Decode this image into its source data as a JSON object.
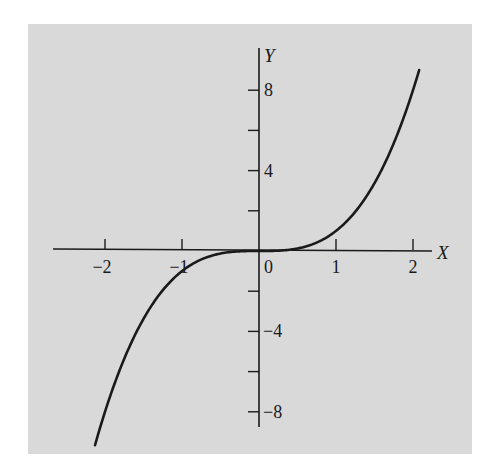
{
  "chart_data": {
    "type": "line",
    "title": "",
    "function": "y = x^3",
    "xlabel": "X",
    "ylabel": "Y",
    "xlim": [
      -2.65,
      2.25
    ],
    "ylim": [
      -8.8,
      10.1
    ],
    "x_ticks": [
      -2,
      -1,
      1,
      2
    ],
    "x_tick_labels": [
      "−2",
      "−1",
      "1",
      "2"
    ],
    "origin_label": "0",
    "y_ticks": [
      -8,
      -6,
      -4,
      -2,
      2,
      4,
      6,
      8
    ],
    "y_tick_labels": [
      {
        "value": 8,
        "label": "8"
      },
      {
        "value": 4,
        "label": "4"
      },
      {
        "value": -4,
        "label": "−4"
      },
      {
        "value": -8,
        "label": "−8"
      }
    ],
    "grid": false,
    "legend": null,
    "series": [
      {
        "name": "y = x^3",
        "x": [
          -2.13,
          -2.0,
          -1.75,
          -1.5,
          -1.25,
          -1.0,
          -0.75,
          -0.5,
          -0.25,
          0,
          0.25,
          0.5,
          0.75,
          1.0,
          1.25,
          1.5,
          1.75,
          2.0,
          2.08
        ],
        "y": [
          -9.66,
          -8.0,
          -5.36,
          -3.38,
          -1.95,
          -1.0,
          -0.42,
          -0.13,
          -0.02,
          0,
          0.02,
          0.13,
          0.42,
          1.0,
          1.95,
          3.38,
          5.36,
          8.0,
          9.0
        ]
      }
    ]
  },
  "colors": {
    "background": "#d9d9d9",
    "ink": "#1a1a1a",
    "page": "#ffffff"
  }
}
